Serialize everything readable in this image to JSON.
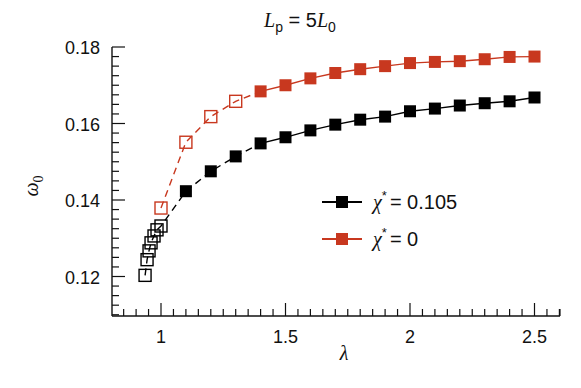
{
  "chart_data": {
    "type": "line",
    "title_parts": {
      "main": "L",
      "sub": "p",
      "eq": " = 5",
      "main2": "L",
      "sub2": "0"
    },
    "xlabel": "λ",
    "ylabel": "ω",
    "ylabel_sub": "0",
    "xlim": [
      0.8,
      2.6
    ],
    "ylim": [
      0.11,
      0.18
    ],
    "xticks": [
      1,
      1.5,
      2,
      2.5
    ],
    "xtick_labels": [
      "1",
      "1.5",
      "2",
      "2.5"
    ],
    "yticks": [
      0.12,
      0.14,
      0.16,
      0.18
    ],
    "ytick_labels": [
      "0.12",
      "0.14",
      "0.16",
      "0.18"
    ],
    "x_minor_step": 0.05,
    "y_minor_step": 0.0025,
    "grid": false,
    "legend_position": "center-right",
    "series": [
      {
        "name": "χ* = 0.105",
        "legend_symbol": "χ",
        "legend_sup": "*",
        "legend_value": "= 0.105",
        "color": "#000000",
        "open_points": {
          "x": [
            0.936,
            0.944,
            0.952,
            0.96,
            0.972,
            0.984,
            1.0
          ],
          "y": [
            0.1203,
            0.1244,
            0.1267,
            0.1288,
            0.1306,
            0.1322,
            0.1332
          ],
          "line_style": "dashed"
        },
        "filled_points": {
          "x": [
            1.1,
            1.2,
            1.3,
            1.4,
            1.5,
            1.6,
            1.7,
            1.8,
            1.9,
            2.0,
            2.1,
            2.2,
            2.3,
            2.4,
            2.5
          ],
          "y": [
            0.1423,
            0.1475,
            0.1514,
            0.1548,
            0.1564,
            0.1582,
            0.1597,
            0.161,
            0.1618,
            0.1632,
            0.1639,
            0.1647,
            0.1653,
            0.1658,
            0.1668
          ],
          "dashed_until_x": 1.4
        }
      },
      {
        "name": "χ* = 0",
        "legend_symbol": "χ",
        "legend_sup": "*",
        "legend_value": "= 0",
        "color": "#c8381f",
        "open_points": {
          "x": [
            1.0,
            1.1,
            1.2,
            1.3
          ],
          "y": [
            0.1379,
            0.1551,
            0.1618,
            0.1658
          ],
          "line_style": "dashed"
        },
        "filled_points": {
          "x": [
            1.4,
            1.5,
            1.6,
            1.7,
            1.8,
            1.9,
            2.0,
            2.1,
            2.2,
            2.3,
            2.4,
            2.5
          ],
          "y": [
            0.1684,
            0.17,
            0.1718,
            0.1732,
            0.1742,
            0.175,
            0.1758,
            0.1761,
            0.1763,
            0.1768,
            0.1774,
            0.1775
          ],
          "dashed_until_x": 1.4
        }
      }
    ]
  }
}
